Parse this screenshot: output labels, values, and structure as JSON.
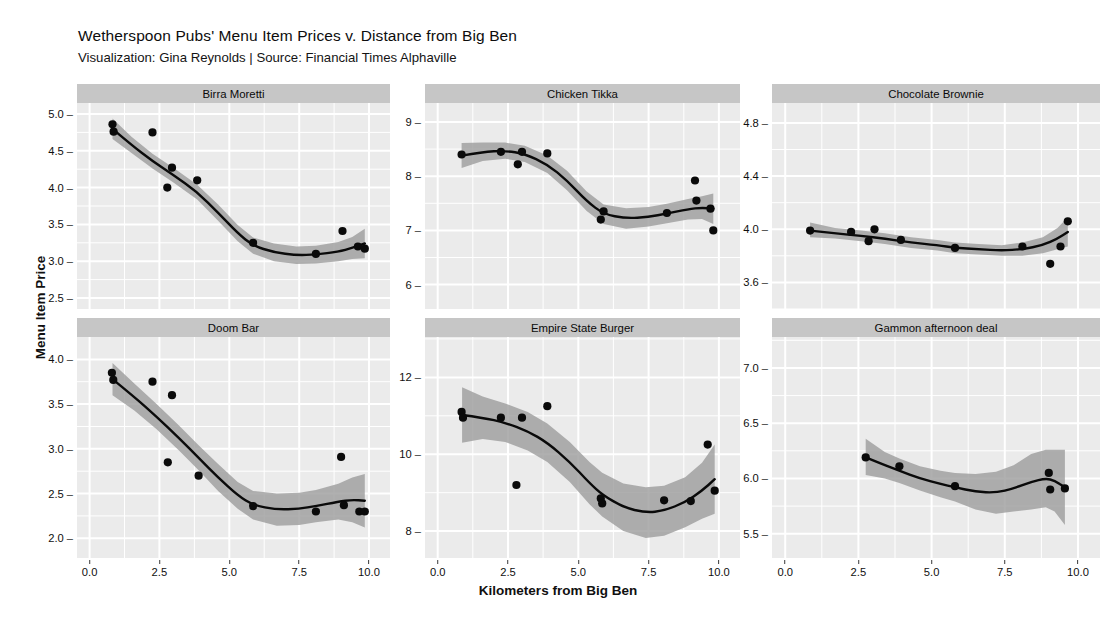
{
  "header": {
    "title": "Wetherspoon Pubs' Menu Item Prices v. Distance from Big Ben",
    "subtitle": "Visualization: Gina Reynolds | Source: Financial Times Alphaville"
  },
  "axes": {
    "y_title": "Menu Item Price",
    "x_title": "Kilometers from Big Ben"
  },
  "style": {
    "panel_background": "#ebebeb",
    "strip_background": "#c6c6c6",
    "grid_color": "#ffffff",
    "point_color": "#0a0a0a",
    "line_color": "#0a0a0a",
    "ribbon_color": "#9a9a9a"
  },
  "chart_data": {
    "type": "scatter",
    "title": "Wetherspoon Pubs' Menu Item Prices v. Distance from Big Ben",
    "subtitle": "Visualization: Gina Reynolds | Source: Financial Times Alphaville",
    "xlabel": "Kilometers from Big Ben",
    "ylabel": "Menu Item Price",
    "grid": true,
    "legend": "none",
    "facet_layout": "3 columns x 2 rows",
    "smoother": "loess with 95% confidence ribbon",
    "shared_x": {
      "ticks": [
        "0.0",
        "2.5",
        "5.0",
        "7.5",
        "10.0"
      ],
      "tick_values": [
        0.0,
        2.5,
        5.0,
        7.5,
        10.0
      ],
      "xlim": [
        -0.45,
        10.75
      ]
    },
    "panels": [
      {
        "name": "Birra Moretti",
        "ylim": [
          2.35,
          5.15
        ],
        "yticks": [
          "2.5",
          "3.0",
          "3.5",
          "4.0",
          "4.5",
          "5.0"
        ],
        "ytick_values": [
          2.5,
          3.0,
          3.5,
          4.0,
          4.5,
          5.0
        ],
        "points": [
          {
            "x": 0.82,
            "y": 4.86
          },
          {
            "x": 0.86,
            "y": 4.76
          },
          {
            "x": 2.25,
            "y": 4.75
          },
          {
            "x": 2.78,
            "y": 4.0
          },
          {
            "x": 2.95,
            "y": 4.27
          },
          {
            "x": 3.85,
            "y": 4.1
          },
          {
            "x": 5.85,
            "y": 3.25
          },
          {
            "x": 8.1,
            "y": 3.1
          },
          {
            "x": 9.05,
            "y": 3.41
          },
          {
            "x": 9.6,
            "y": 3.2
          },
          {
            "x": 9.85,
            "y": 3.17
          }
        ],
        "smooth": [
          {
            "x": 0.82,
            "y": 4.8,
            "lo": 4.66,
            "hi": 4.94
          },
          {
            "x": 1.5,
            "y": 4.58,
            "lo": 4.47,
            "hi": 4.69
          },
          {
            "x": 2.25,
            "y": 4.36,
            "lo": 4.26,
            "hi": 4.46
          },
          {
            "x": 3.0,
            "y": 4.17,
            "lo": 4.07,
            "hi": 4.27
          },
          {
            "x": 3.85,
            "y": 3.94,
            "lo": 3.84,
            "hi": 4.04
          },
          {
            "x": 4.6,
            "y": 3.66,
            "lo": 3.55,
            "hi": 3.77
          },
          {
            "x": 5.3,
            "y": 3.38,
            "lo": 3.27,
            "hi": 3.49
          },
          {
            "x": 5.85,
            "y": 3.21,
            "lo": 3.1,
            "hi": 3.32
          },
          {
            "x": 6.6,
            "y": 3.12,
            "lo": 3.0,
            "hi": 3.24
          },
          {
            "x": 7.4,
            "y": 3.08,
            "lo": 2.96,
            "hi": 3.2
          },
          {
            "x": 8.1,
            "y": 3.09,
            "lo": 2.97,
            "hi": 3.21
          },
          {
            "x": 8.9,
            "y": 3.13,
            "lo": 3.0,
            "hi": 3.26
          },
          {
            "x": 9.4,
            "y": 3.18,
            "lo": 3.03,
            "hi": 3.33
          },
          {
            "x": 9.85,
            "y": 3.24,
            "lo": 3.04,
            "hi": 3.44
          }
        ]
      },
      {
        "name": "Chicken Tikka",
        "ylim": [
          5.55,
          9.35
        ],
        "yticks": [
          "6",
          "7",
          "8",
          "9"
        ],
        "ytick_values": [
          6,
          7,
          8,
          9
        ],
        "points": [
          {
            "x": 0.85,
            "y": 8.4
          },
          {
            "x": 2.25,
            "y": 8.45
          },
          {
            "x": 2.85,
            "y": 8.22
          },
          {
            "x": 3.0,
            "y": 8.45
          },
          {
            "x": 3.9,
            "y": 8.42
          },
          {
            "x": 5.8,
            "y": 7.2
          },
          {
            "x": 5.9,
            "y": 7.35
          },
          {
            "x": 8.15,
            "y": 7.32
          },
          {
            "x": 9.15,
            "y": 7.92
          },
          {
            "x": 9.2,
            "y": 7.55
          },
          {
            "x": 9.7,
            "y": 7.4
          },
          {
            "x": 9.8,
            "y": 7.0
          }
        ],
        "smooth": [
          {
            "x": 0.85,
            "y": 8.38,
            "lo": 8.15,
            "hi": 8.61
          },
          {
            "x": 1.6,
            "y": 8.45,
            "lo": 8.28,
            "hi": 8.62
          },
          {
            "x": 2.4,
            "y": 8.47,
            "lo": 8.32,
            "hi": 8.62
          },
          {
            "x": 3.1,
            "y": 8.41,
            "lo": 8.26,
            "hi": 8.56
          },
          {
            "x": 3.9,
            "y": 8.22,
            "lo": 8.06,
            "hi": 8.38
          },
          {
            "x": 4.6,
            "y": 7.92,
            "lo": 7.74,
            "hi": 8.1
          },
          {
            "x": 5.3,
            "y": 7.54,
            "lo": 7.36,
            "hi": 7.72
          },
          {
            "x": 5.9,
            "y": 7.3,
            "lo": 7.12,
            "hi": 7.48
          },
          {
            "x": 6.7,
            "y": 7.22,
            "lo": 7.03,
            "hi": 7.41
          },
          {
            "x": 7.5,
            "y": 7.25,
            "lo": 7.07,
            "hi": 7.43
          },
          {
            "x": 8.15,
            "y": 7.31,
            "lo": 7.13,
            "hi": 7.49
          },
          {
            "x": 8.9,
            "y": 7.39,
            "lo": 7.2,
            "hi": 7.58
          },
          {
            "x": 9.4,
            "y": 7.42,
            "lo": 7.21,
            "hi": 7.63
          },
          {
            "x": 9.8,
            "y": 7.4,
            "lo": 7.12,
            "hi": 7.68
          }
        ]
      },
      {
        "name": "Chocolate Brownie",
        "ylim": [
          3.4,
          4.95
        ],
        "yticks": [
          "3.6",
          "4.0",
          "4.4",
          "4.8"
        ],
        "ytick_values": [
          3.6,
          4.0,
          4.4,
          4.8
        ],
        "points": [
          {
            "x": 0.85,
            "y": 3.99
          },
          {
            "x": 2.25,
            "y": 3.98
          },
          {
            "x": 2.85,
            "y": 3.91
          },
          {
            "x": 3.05,
            "y": 4.0
          },
          {
            "x": 3.95,
            "y": 3.92
          },
          {
            "x": 5.8,
            "y": 3.86
          },
          {
            "x": 8.1,
            "y": 3.87
          },
          {
            "x": 9.05,
            "y": 3.74
          },
          {
            "x": 9.4,
            "y": 3.87
          },
          {
            "x": 9.65,
            "y": 4.06
          }
        ],
        "smooth": [
          {
            "x": 0.85,
            "y": 3.99,
            "lo": 3.94,
            "hi": 4.05
          },
          {
            "x": 1.7,
            "y": 3.97,
            "lo": 3.93,
            "hi": 4.01
          },
          {
            "x": 2.6,
            "y": 3.95,
            "lo": 3.91,
            "hi": 3.99
          },
          {
            "x": 3.4,
            "y": 3.93,
            "lo": 3.89,
            "hi": 3.97
          },
          {
            "x": 4.3,
            "y": 3.9,
            "lo": 3.86,
            "hi": 3.94
          },
          {
            "x": 5.2,
            "y": 3.88,
            "lo": 3.84,
            "hi": 3.92
          },
          {
            "x": 5.8,
            "y": 3.86,
            "lo": 3.82,
            "hi": 3.9
          },
          {
            "x": 6.6,
            "y": 3.85,
            "lo": 3.81,
            "hi": 3.89
          },
          {
            "x": 7.4,
            "y": 3.84,
            "lo": 3.8,
            "hi": 3.88
          },
          {
            "x": 8.1,
            "y": 3.85,
            "lo": 3.8,
            "hi": 3.9
          },
          {
            "x": 8.8,
            "y": 3.88,
            "lo": 3.82,
            "hi": 3.94
          },
          {
            "x": 9.3,
            "y": 3.93,
            "lo": 3.85,
            "hi": 4.01
          },
          {
            "x": 9.65,
            "y": 3.98,
            "lo": 3.87,
            "hi": 4.09
          }
        ]
      },
      {
        "name": "Doom Bar",
        "ylim": [
          1.78,
          4.25
        ],
        "yticks": [
          "2.0",
          "2.5",
          "3.0",
          "3.5",
          "4.0"
        ],
        "ytick_values": [
          2.0,
          2.5,
          3.0,
          3.5,
          4.0
        ],
        "points": [
          {
            "x": 0.8,
            "y": 3.85
          },
          {
            "x": 0.85,
            "y": 3.77
          },
          {
            "x": 2.25,
            "y": 3.75
          },
          {
            "x": 2.95,
            "y": 3.6
          },
          {
            "x": 2.8,
            "y": 2.85
          },
          {
            "x": 3.9,
            "y": 2.7
          },
          {
            "x": 5.85,
            "y": 2.36
          },
          {
            "x": 8.1,
            "y": 2.3
          },
          {
            "x": 9.0,
            "y": 2.91
          },
          {
            "x": 9.1,
            "y": 2.37
          },
          {
            "x": 9.65,
            "y": 2.3
          },
          {
            "x": 9.85,
            "y": 2.3
          }
        ],
        "smooth": [
          {
            "x": 0.82,
            "y": 3.78,
            "lo": 3.6,
            "hi": 3.96
          },
          {
            "x": 1.6,
            "y": 3.58,
            "lo": 3.43,
            "hi": 3.73
          },
          {
            "x": 2.4,
            "y": 3.36,
            "lo": 3.22,
            "hi": 3.5
          },
          {
            "x": 3.2,
            "y": 3.12,
            "lo": 2.98,
            "hi": 3.26
          },
          {
            "x": 3.9,
            "y": 2.9,
            "lo": 2.76,
            "hi": 3.04
          },
          {
            "x": 4.6,
            "y": 2.68,
            "lo": 2.53,
            "hi": 2.83
          },
          {
            "x": 5.3,
            "y": 2.48,
            "lo": 2.33,
            "hi": 2.63
          },
          {
            "x": 5.85,
            "y": 2.37,
            "lo": 2.21,
            "hi": 2.53
          },
          {
            "x": 6.7,
            "y": 2.32,
            "lo": 2.14,
            "hi": 2.5
          },
          {
            "x": 7.5,
            "y": 2.33,
            "lo": 2.15,
            "hi": 2.51
          },
          {
            "x": 8.1,
            "y": 2.36,
            "lo": 2.18,
            "hi": 2.54
          },
          {
            "x": 8.9,
            "y": 2.41,
            "lo": 2.21,
            "hi": 2.61
          },
          {
            "x": 9.4,
            "y": 2.43,
            "lo": 2.18,
            "hi": 2.68
          },
          {
            "x": 9.85,
            "y": 2.42,
            "lo": 2.12,
            "hi": 2.72
          }
        ]
      },
      {
        "name": "Empire State Burger",
        "ylim": [
          7.3,
          13.05
        ],
        "yticks": [
          "8",
          "10",
          "12"
        ],
        "ytick_values": [
          8,
          10,
          12
        ],
        "points": [
          {
            "x": 0.85,
            "y": 11.1
          },
          {
            "x": 0.9,
            "y": 10.95
          },
          {
            "x": 2.25,
            "y": 10.95
          },
          {
            "x": 2.8,
            "y": 9.2
          },
          {
            "x": 3.0,
            "y": 10.95
          },
          {
            "x": 3.9,
            "y": 11.25
          },
          {
            "x": 5.8,
            "y": 8.85
          },
          {
            "x": 5.85,
            "y": 8.72
          },
          {
            "x": 8.05,
            "y": 8.8
          },
          {
            "x": 9.0,
            "y": 8.78
          },
          {
            "x": 9.6,
            "y": 10.25
          },
          {
            "x": 9.85,
            "y": 9.05
          }
        ],
        "smooth": [
          {
            "x": 0.87,
            "y": 11.02,
            "lo": 10.3,
            "hi": 11.74
          },
          {
            "x": 1.6,
            "y": 10.95,
            "lo": 10.4,
            "hi": 11.5
          },
          {
            "x": 2.4,
            "y": 10.82,
            "lo": 10.32,
            "hi": 11.32
          },
          {
            "x": 3.2,
            "y": 10.6,
            "lo": 10.1,
            "hi": 11.1
          },
          {
            "x": 3.9,
            "y": 10.3,
            "lo": 9.8,
            "hi": 10.8
          },
          {
            "x": 4.7,
            "y": 9.8,
            "lo": 9.28,
            "hi": 10.32
          },
          {
            "x": 5.4,
            "y": 9.25,
            "lo": 8.7,
            "hi": 9.8
          },
          {
            "x": 5.85,
            "y": 8.95,
            "lo": 8.38,
            "hi": 9.52
          },
          {
            "x": 6.6,
            "y": 8.62,
            "lo": 8.0,
            "hi": 9.24
          },
          {
            "x": 7.4,
            "y": 8.48,
            "lo": 7.82,
            "hi": 9.14
          },
          {
            "x": 8.05,
            "y": 8.53,
            "lo": 7.88,
            "hi": 9.18
          },
          {
            "x": 8.8,
            "y": 8.75,
            "lo": 8.1,
            "hi": 9.4
          },
          {
            "x": 9.4,
            "y": 9.05,
            "lo": 8.32,
            "hi": 9.78
          },
          {
            "x": 9.85,
            "y": 9.35,
            "lo": 8.45,
            "hi": 10.25
          }
        ]
      },
      {
        "name": "Gammon afternoon deal",
        "ylim": [
          5.28,
          7.28
        ],
        "yticks": [
          "5.5",
          "6.0",
          "6.5",
          "7.0"
        ],
        "ytick_values": [
          5.5,
          6.0,
          6.5,
          7.0
        ],
        "points": [
          {
            "x": 2.75,
            "y": 6.19
          },
          {
            "x": 3.9,
            "y": 6.11
          },
          {
            "x": 5.8,
            "y": 5.93
          },
          {
            "x": 9.0,
            "y": 6.05
          },
          {
            "x": 9.05,
            "y": 5.9
          },
          {
            "x": 9.55,
            "y": 5.91
          }
        ],
        "smooth": [
          {
            "x": 2.75,
            "y": 6.19,
            "lo": 6.03,
            "hi": 6.36
          },
          {
            "x": 3.4,
            "y": 6.12,
            "lo": 6.0,
            "hi": 6.24
          },
          {
            "x": 3.9,
            "y": 6.07,
            "lo": 5.96,
            "hi": 6.18
          },
          {
            "x": 4.6,
            "y": 6.0,
            "lo": 5.89,
            "hi": 6.11
          },
          {
            "x": 5.3,
            "y": 5.95,
            "lo": 5.83,
            "hi": 6.07
          },
          {
            "x": 5.8,
            "y": 5.92,
            "lo": 5.79,
            "hi": 6.05
          },
          {
            "x": 6.5,
            "y": 5.88,
            "lo": 5.72,
            "hi": 6.04
          },
          {
            "x": 7.2,
            "y": 5.87,
            "lo": 5.68,
            "hi": 6.06
          },
          {
            "x": 7.8,
            "y": 5.91,
            "lo": 5.7,
            "hi": 6.12
          },
          {
            "x": 8.4,
            "y": 5.97,
            "lo": 5.72,
            "hi": 6.22
          },
          {
            "x": 8.9,
            "y": 6.0,
            "lo": 5.74,
            "hi": 6.26
          },
          {
            "x": 9.2,
            "y": 5.98,
            "lo": 5.7,
            "hi": 6.26
          },
          {
            "x": 9.55,
            "y": 5.92,
            "lo": 5.58,
            "hi": 6.26
          }
        ]
      }
    ]
  }
}
